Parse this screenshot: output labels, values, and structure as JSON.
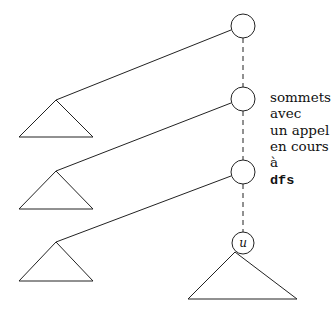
{
  "diagram": {
    "title": "",
    "colors": {
      "stroke": "#222222",
      "text": "#111111",
      "background": "#ffffff"
    },
    "annotation": {
      "lines": [
        "sommets",
        "avec",
        "un appel",
        "en cours",
        "à"
      ],
      "code": "dfs"
    },
    "nodes": [
      {
        "id": "ancestor-1",
        "label": ""
      },
      {
        "id": "ancestor-2",
        "label": ""
      },
      {
        "id": "ancestor-3",
        "label": ""
      },
      {
        "id": "current",
        "label": "u"
      }
    ],
    "subtrees": [
      {
        "id": "subtree-1",
        "attached_to": "ancestor-1"
      },
      {
        "id": "subtree-2",
        "attached_to": "ancestor-2"
      },
      {
        "id": "subtree-3",
        "attached_to": "ancestor-3"
      },
      {
        "id": "subtree-u",
        "attached_to": "current"
      }
    ]
  }
}
